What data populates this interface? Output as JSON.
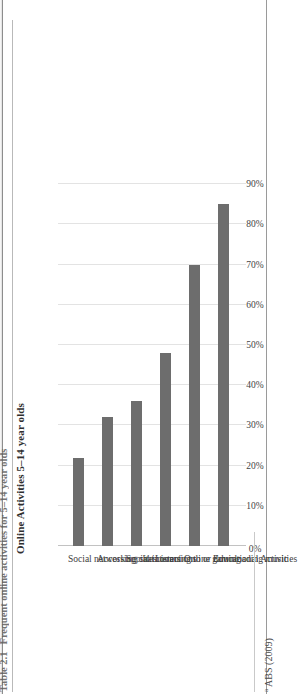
{
  "page": {
    "caption_number": "Table 2.1",
    "caption_text": "Frequent online activities for 5–14 year olds",
    "footnote_marker": "a",
    "footnote_text": "ABS (2009)"
  },
  "chart_data": {
    "type": "bar",
    "orientation": "vertical",
    "title": "Online Activities 5–14 year olds",
    "xlabel": "",
    "ylabel": "",
    "categories": [
      "Social networking sites",
      "Accessing chat rooms",
      "Social interactions",
      "Listening to or downloading music",
      "Online gaming",
      "Educational Activities"
    ],
    "values": [
      22,
      32,
      36,
      48,
      70,
      85
    ],
    "value_unit": "%",
    "tick_labels": [
      "0%",
      "10%",
      "20%",
      "30%",
      "40%",
      "50%",
      "60%",
      "70%",
      "80%",
      "90%"
    ],
    "tick_values": [
      0,
      10,
      20,
      30,
      40,
      50,
      60,
      70,
      80,
      90
    ],
    "ylim": [
      0,
      95
    ],
    "grid": true,
    "legend": false,
    "legend_position": "none",
    "bar_color": "#6d6d6d",
    "gridline_color": "#e3e3e3",
    "background_color": "#ffffff"
  }
}
